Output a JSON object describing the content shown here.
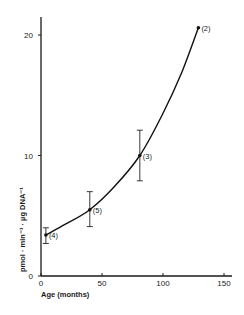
{
  "chart_data": {
    "type": "scatter",
    "title": "",
    "xlabel": "Age (months)",
    "ylabel": "pmol · min⁻¹ · µg DNA⁻¹",
    "xlim": [
      0,
      155
    ],
    "ylim": [
      0,
      21.5
    ],
    "xticks": [
      0,
      50,
      100,
      150
    ],
    "yticks": [
      0,
      10,
      20
    ],
    "grid": false,
    "legend": null,
    "series": [
      {
        "name": "measurements",
        "points": [
          {
            "x": 4,
            "y": 3.4,
            "err_low": 2.7,
            "err_high": 4.0,
            "label": "(4)"
          },
          {
            "x": 40,
            "y": 5.5,
            "err_low": 4.1,
            "err_high": 7.0,
            "label": "(5)"
          },
          {
            "x": 81,
            "y": 10.0,
            "err_low": 7.9,
            "err_high": 12.1,
            "label": "(3)"
          },
          {
            "x": 129,
            "y": 20.6,
            "err_low": null,
            "err_high": null,
            "label": "(2)"
          }
        ]
      }
    ],
    "fit_curve": {
      "description": "exponential-like fitted curve through points",
      "x": [
        4,
        20,
        40,
        60,
        81,
        100,
        115,
        129
      ],
      "y": [
        3.4,
        4.3,
        5.5,
        7.4,
        10.0,
        13.5,
        16.8,
        20.6
      ]
    }
  },
  "axes": {
    "x_tick_labels": [
      "0",
      "50",
      "100",
      "150"
    ],
    "y_tick_labels": [
      "0",
      "10",
      "20"
    ],
    "x_title": "Age (months)",
    "y_title": "pmol · min⁻¹ · µg DNA⁻¹"
  }
}
